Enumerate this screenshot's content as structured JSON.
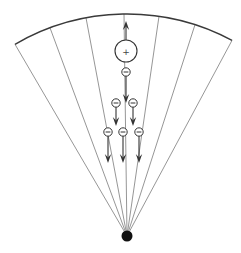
{
  "diagram": {
    "colors": {
      "arc": "#3a3a3a",
      "rays": "#8a8a8a",
      "particles": "#333333",
      "apex": "#111111"
    },
    "apex": {
      "x": 127,
      "y": 236,
      "r": 5.5
    },
    "arc": {
      "radius": 222,
      "start_x": 15,
      "start_y": 46,
      "end_x": 232,
      "end_y": 41
    },
    "rays_end_x": [
      15,
      50,
      86,
      124,
      159,
      195,
      232
    ],
    "positive_ion": {
      "x": 126,
      "y": 51,
      "r": 11,
      "label": "+",
      "arrow": {
        "direction": "up",
        "from_y": 40,
        "to_y": 21
      }
    },
    "electrons": [
      {
        "x": 126,
        "y": 72,
        "label": "−",
        "arrow_to_y": 103
      },
      {
        "x": 116,
        "y": 103,
        "label": "−",
        "arrow_to_y": 126
      },
      {
        "x": 133,
        "y": 103,
        "label": "−",
        "arrow_to_y": 126
      },
      {
        "x": 108,
        "y": 132,
        "label": "−",
        "arrow_to_y": 163
      },
      {
        "x": 123,
        "y": 132,
        "label": "−",
        "arrow_to_y": 163
      },
      {
        "x": 139,
        "y": 132,
        "label": "−",
        "arrow_to_y": 163
      }
    ]
  }
}
